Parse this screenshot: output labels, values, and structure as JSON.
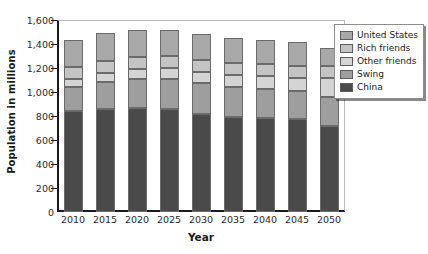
{
  "chart_data": {
    "type": "bar",
    "stacked": true,
    "title": "",
    "xlabel": "Year",
    "ylabel": "Population in millions",
    "categories": [
      "2010",
      "2015",
      "2020",
      "2025",
      "2030",
      "2035",
      "2040",
      "2045",
      "2050"
    ],
    "ylim": [
      0,
      1600
    ],
    "yticks": [
      0,
      200,
      400,
      600,
      800,
      1000,
      1200,
      1400,
      1600
    ],
    "ytick_labels": [
      "0",
      "200",
      "400",
      "600",
      "800",
      "1,000",
      "1,200",
      "1,400",
      "1,600"
    ],
    "grid": false,
    "legend_position": "top-right",
    "series": [
      {
        "name": "China",
        "color": "#4a4a4a",
        "values": [
          845,
          860,
          870,
          860,
          820,
          790,
          780,
          775,
          720
        ]
      },
      {
        "name": "Swing",
        "color": "#9e9e9e",
        "values": [
          200,
          225,
          240,
          250,
          255,
          250,
          245,
          235,
          235
        ]
      },
      {
        "name": "Other friends",
        "color": "#d4d4d4",
        "values": [
          65,
          75,
          85,
          90,
          95,
          100,
          105,
          110,
          165
        ]
      },
      {
        "name": "Rich friends",
        "color": "#c4c4c4",
        "values": [
          95,
          100,
          100,
          100,
          100,
          100,
          100,
          100,
          95
        ]
      },
      {
        "name": "United States",
        "color": "#a8a8a8",
        "values": [
          230,
          230,
          225,
          220,
          215,
          210,
          205,
          200,
          155
        ]
      }
    ],
    "totals": [
      1435,
      1490,
      1520,
      1520,
      1485,
      1450,
      1435,
      1420,
      1370
    ]
  },
  "legend": {
    "items": [
      {
        "label": "United States",
        "color": "#a8a8a8"
      },
      {
        "label": "Rich friends",
        "color": "#c4c4c4"
      },
      {
        "label": "Other friends",
        "color": "#d4d4d4"
      },
      {
        "label": "Swing",
        "color": "#9e9e9e"
      },
      {
        "label": "China",
        "color": "#4a4a4a"
      }
    ]
  }
}
